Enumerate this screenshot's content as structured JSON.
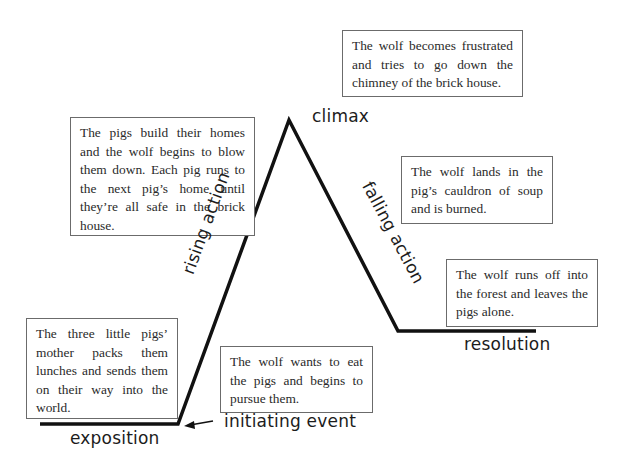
{
  "diagram": {
    "type": "plot-diagram",
    "stages": {
      "exposition": {
        "label": "exposition",
        "text": "The three little pigs’ mother packs them lunches and sends them on their way into the world."
      },
      "initiating_event": {
        "label": "initiating event",
        "text": "The wolf wants to eat the pigs and begins to pursue them."
      },
      "rising_action": {
        "label": "rising action",
        "text": "The pigs build their homes and the wolf begins to blow them down. Each pig runs to the next pig’s home until they’re all safe in the brick house."
      },
      "climax": {
        "label": "climax",
        "text": "The wolf becomes frustrated and tries to go down the chimney of the brick house."
      },
      "falling_action": {
        "label": "falling action",
        "text": "The wolf lands in the pig’s cauldron of soup and is burned."
      },
      "resolution": {
        "label": "resolution",
        "text": "The wolf runs off into the forest and leaves the pigs alone."
      }
    },
    "colors": {
      "line": "#111111",
      "box_border": "#6b6b6b",
      "text": "#2a2a2a"
    }
  }
}
